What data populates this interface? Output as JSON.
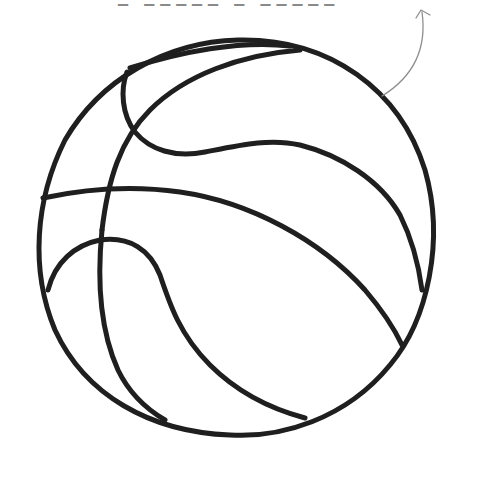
{
  "caption": {
    "text": "▁ ▁▁▁▁▁ ▁ ▁▁▁▁▁",
    "note": "cropped handwritten annotation, only bottoms of characters visible"
  },
  "illustration": {
    "subject": "basketball",
    "style": "hand-drawn line art",
    "stroke_color": "#1f1f1f",
    "annotation_arrow_color": "#8f8f8f",
    "background": "#ffffff"
  }
}
